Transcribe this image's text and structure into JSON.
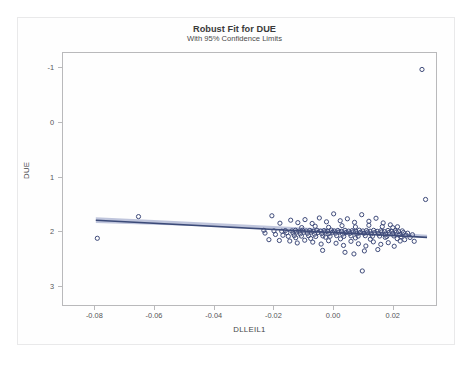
{
  "figure": {
    "title": "Robust Fit for DUE",
    "subtitle": "With 95% Confidence Limits"
  },
  "axis": {
    "x_label": "DLLEIL1",
    "y_label": "DUE",
    "x_ticks": [
      "-0.08",
      "-0.06",
      "-0.04",
      "-0.02",
      "0.00",
      "0.02"
    ],
    "y_ticks": [
      "3",
      "2",
      "1",
      "0",
      "-1"
    ]
  },
  "colors": {
    "marker_stroke": "#3f4b7a",
    "fit_line": "#3b4a78",
    "confidence_band": "#b4bbd6",
    "axis": "#b9b9bb",
    "text": "#4a4a4a",
    "background": "#fefefe"
  },
  "chart_data": {
    "type": "scatter",
    "title": "Robust Fit for DUE",
    "subtitle": "With 95% Confidence Limits",
    "xlabel": "DLLEIL1",
    "ylabel": "DUE",
    "xlim": [
      -0.0905,
      0.0345
    ],
    "ylim": [
      -1.34,
      3.25
    ],
    "x_ticks": [
      -0.08,
      -0.06,
      -0.04,
      -0.02,
      0.0,
      0.02
    ],
    "y_ticks": [
      -1,
      0,
      1,
      2,
      3
    ],
    "grid": false,
    "legend": null,
    "marker": {
      "shape": "circle",
      "filled": false,
      "radius_px": 2.1
    },
    "fit_line": {
      "label": "Robust fit",
      "x": [
        -0.0795,
        0.0315
      ],
      "y": [
        0.205,
        -0.108
      ],
      "slope": -2.82,
      "intercept": -0.019
    },
    "confidence_band": {
      "level": 0.95,
      "x": [
        -0.0795,
        -0.06,
        -0.04,
        -0.02,
        0.0,
        0.01,
        0.02,
        0.0315
      ],
      "upper": [
        0.258,
        0.208,
        0.154,
        0.099,
        0.043,
        0.013,
        -0.02,
        -0.06
      ],
      "lower": [
        0.152,
        0.121,
        0.09,
        0.053,
        0.009,
        -0.019,
        -0.052,
        -0.095
      ]
    },
    "points": [
      [
        -0.079,
        -0.125
      ],
      [
        -0.0652,
        0.27
      ],
      [
        -0.0232,
        0.02
      ],
      [
        -0.0228,
        -0.03
      ],
      [
        -0.0205,
        0.285
      ],
      [
        -0.0198,
        0.01
      ],
      [
        -0.0193,
        -0.055
      ],
      [
        -0.0178,
        0.15
      ],
      [
        -0.0172,
        0.005
      ],
      [
        -0.0168,
        -0.07
      ],
      [
        -0.016,
        0.015
      ],
      [
        -0.0155,
        -0.02
      ],
      [
        -0.015,
        -0.09
      ],
      [
        -0.0142,
        0.205
      ],
      [
        -0.0138,
        0.01
      ],
      [
        -0.0134,
        -0.03
      ],
      [
        -0.013,
        -0.075
      ],
      [
        -0.0126,
        0.02
      ],
      [
        -0.0122,
        -0.01
      ],
      [
        -0.0118,
        0.16
      ],
      [
        -0.0114,
        0.005
      ],
      [
        -0.011,
        -0.045
      ],
      [
        -0.0106,
        -0.085
      ],
      [
        -0.0102,
        0.02
      ],
      [
        -0.0098,
        -0.015
      ],
      [
        -0.0094,
        0.215
      ],
      [
        -0.009,
        0.008
      ],
      [
        -0.0086,
        -0.035
      ],
      [
        -0.0082,
        -0.078
      ],
      [
        -0.0078,
        0.018
      ],
      [
        -0.0074,
        -0.012
      ],
      [
        -0.007,
        0.145
      ],
      [
        -0.0066,
        0.002
      ],
      [
        -0.0062,
        -0.05
      ],
      [
        -0.0058,
        -0.092
      ],
      [
        -0.0054,
        0.022
      ],
      [
        -0.005,
        -0.018
      ],
      [
        -0.0046,
        0.245
      ],
      [
        -0.0042,
        0.006
      ],
      [
        -0.0038,
        -0.038
      ],
      [
        -0.0034,
        -0.082
      ],
      [
        -0.003,
        0.016
      ],
      [
        -0.0026,
        -0.008
      ],
      [
        -0.0022,
        0.175
      ],
      [
        -0.0018,
        0.004
      ],
      [
        -0.0014,
        -0.042
      ],
      [
        -0.001,
        -0.088
      ],
      [
        -0.0006,
        0.024
      ],
      [
        -0.0002,
        -0.016
      ],
      [
        0.0002,
        0.32
      ],
      [
        0.0004,
        0.01
      ],
      [
        0.0008,
        -0.032
      ],
      [
        0.0012,
        -0.076
      ],
      [
        0.0016,
        0.018
      ],
      [
        0.002,
        -0.012
      ],
      [
        0.0024,
        0.195
      ],
      [
        0.0028,
        0.002
      ],
      [
        0.0032,
        -0.048
      ],
      [
        0.0036,
        -0.09
      ],
      [
        0.004,
        0.02
      ],
      [
        0.0044,
        -0.02
      ],
      [
        0.0048,
        0.23
      ],
      [
        0.0052,
        0.006
      ],
      [
        0.0056,
        -0.036
      ],
      [
        0.006,
        -0.08
      ],
      [
        0.0064,
        0.014
      ],
      [
        0.0068,
        -0.006
      ],
      [
        0.0072,
        0.165
      ],
      [
        0.0076,
        0.0
      ],
      [
        0.008,
        -0.044
      ],
      [
        0.0084,
        -0.086
      ],
      [
        0.0088,
        0.022
      ],
      [
        0.0092,
        -0.014
      ],
      [
        0.0096,
        0.305
      ],
      [
        0.01,
        0.008
      ],
      [
        0.0104,
        -0.034
      ],
      [
        0.0108,
        -0.078
      ],
      [
        0.0112,
        0.016
      ],
      [
        0.0116,
        -0.01
      ],
      [
        0.012,
        0.185
      ],
      [
        0.0124,
        0.004
      ],
      [
        0.0128,
        -0.046
      ],
      [
        0.0132,
        -0.088
      ],
      [
        0.0136,
        0.02
      ],
      [
        0.014,
        -0.018
      ],
      [
        0.0144,
        0.24
      ],
      [
        0.0148,
        0.002
      ],
      [
        0.0152,
        -0.04
      ],
      [
        0.0156,
        -0.084
      ],
      [
        0.016,
        0.012
      ],
      [
        0.0164,
        -0.008
      ],
      [
        0.0168,
        0.155
      ],
      [
        0.0172,
        -0.002
      ],
      [
        0.0176,
        -0.05
      ],
      [
        0.018,
        -0.092
      ],
      [
        0.0184,
        0.018
      ],
      [
        0.0188,
        -0.016
      ],
      [
        0.0192,
        0.12
      ],
      [
        0.0196,
        0.004
      ],
      [
        0.02,
        -0.038
      ],
      [
        0.0204,
        -0.082
      ],
      [
        0.0208,
        0.014
      ],
      [
        0.0212,
        -0.012
      ],
      [
        0.0216,
        0.085
      ],
      [
        0.022,
        -0.004
      ],
      [
        0.0224,
        -0.055
      ],
      [
        0.0228,
        -0.095
      ],
      [
        0.0232,
        0.01
      ],
      [
        0.0236,
        -0.02
      ],
      [
        0.024,
        -0.15
      ],
      [
        0.0244,
        -0.065
      ],
      [
        0.025,
        -0.032
      ],
      [
        0.0258,
        -0.11
      ],
      [
        0.0266,
        -0.06
      ],
      [
        0.0272,
        -0.18
      ],
      [
        -0.0215,
        -0.15
      ],
      [
        -0.018,
        -0.165
      ],
      [
        -0.0145,
        -0.175
      ],
      [
        -0.012,
        -0.21
      ],
      [
        -0.0095,
        -0.16
      ],
      [
        -0.0068,
        -0.195
      ],
      [
        -0.004,
        -0.23
      ],
      [
        -0.0015,
        -0.17
      ],
      [
        0.001,
        -0.215
      ],
      [
        0.0035,
        -0.255
      ],
      [
        0.006,
        -0.18
      ],
      [
        0.0085,
        -0.225
      ],
      [
        0.011,
        -0.265
      ],
      [
        0.0135,
        -0.19
      ],
      [
        0.016,
        -0.235
      ],
      [
        0.0185,
        -0.205
      ],
      [
        0.0205,
        -0.27
      ],
      [
        0.0225,
        -0.175
      ],
      [
        -0.0105,
        0.07
      ],
      [
        -0.006,
        0.095
      ],
      [
        -0.0015,
        0.075
      ],
      [
        0.003,
        0.105
      ],
      [
        0.0075,
        0.082
      ],
      [
        0.012,
        0.112
      ],
      [
        0.0165,
        0.088
      ],
      [
        0.02,
        0.068
      ],
      [
        -0.0125,
        -0.115
      ],
      [
        -0.0075,
        -0.128
      ],
      [
        -0.0025,
        -0.105
      ],
      [
        0.0025,
        -0.135
      ],
      [
        0.0075,
        -0.118
      ],
      [
        0.0125,
        -0.142
      ],
      [
        0.0175,
        -0.108
      ],
      [
        0.0215,
        -0.132
      ],
      [
        0.004,
        -0.38
      ],
      [
        0.0105,
        -0.355
      ],
      [
        0.015,
        -0.33
      ],
      [
        -0.0035,
        -0.345
      ],
      [
        0.007,
        -0.41
      ],
      [
        0.0098,
        -0.72
      ],
      [
        0.031,
        0.582
      ],
      [
        0.0298,
        2.95
      ]
    ]
  }
}
